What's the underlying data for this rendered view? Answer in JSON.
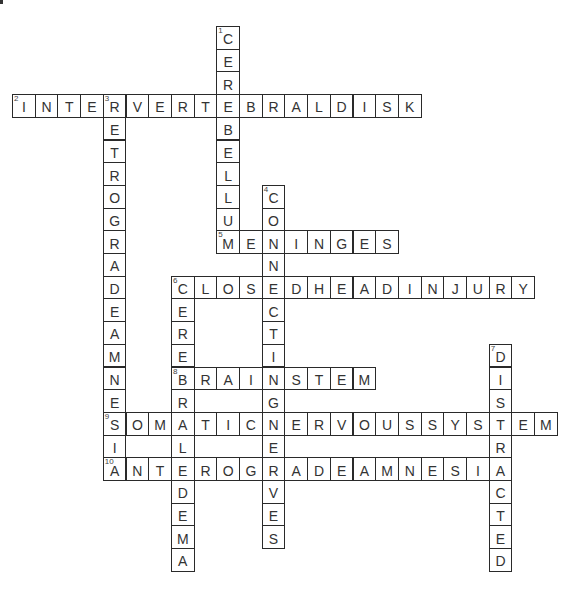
{
  "puzzle": {
    "grid": {
      "origin_x": 12,
      "origin_y": 26,
      "cell": 22.7
    },
    "entries": [
      {
        "number": "1",
        "direction": "down",
        "row": 0,
        "col": 9,
        "answer": "CEREBELLUM"
      },
      {
        "number": "2",
        "direction": "across",
        "row": 3,
        "col": 0,
        "answer": "INTERVERTEBRALDISK"
      },
      {
        "number": "3",
        "direction": "down",
        "row": 3,
        "col": 4,
        "answer": "RETROGRADEAMNESIA"
      },
      {
        "number": "4",
        "direction": "down",
        "row": 7,
        "col": 11,
        "answer": "CONNECTINGNERVES"
      },
      {
        "number": "5",
        "direction": "across",
        "row": 9,
        "col": 9,
        "answer": "MENINGES"
      },
      {
        "number": "6",
        "direction": "across",
        "row": 11,
        "col": 7,
        "answer": "CLOSEDHEADINJURY"
      },
      {
        "number": "6",
        "direction": "down",
        "row": 11,
        "col": 7,
        "answer": "CEREBRALEDEMA"
      },
      {
        "number": "7",
        "direction": "down",
        "row": 14,
        "col": 21,
        "answer": "DISTRACTED"
      },
      {
        "number": "8",
        "direction": "across",
        "row": 15,
        "col": 7,
        "answer": "BRAINSTEM"
      },
      {
        "number": "9",
        "direction": "across",
        "row": 17,
        "col": 4,
        "answer": "SOMATICNERVOUSSYSTEM"
      },
      {
        "number": "10",
        "direction": "across",
        "row": 19,
        "col": 4,
        "answer": "ANTEROGRADEAMNESIA"
      }
    ]
  }
}
